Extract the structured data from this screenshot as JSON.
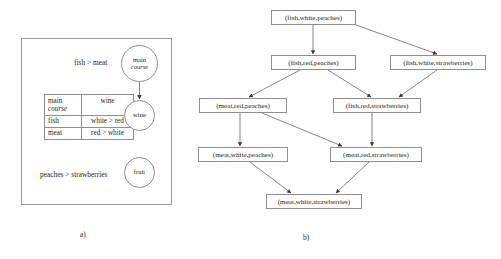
{
  "figure": {
    "captions": {
      "a": "a)",
      "b": "b)"
    }
  },
  "panel_a": {
    "statement_top": "fish > meat",
    "statement_bottom": "peaches > strawberries",
    "cp_table": {
      "headers": [
        "main course",
        "wine"
      ],
      "header_left_line1": "main",
      "header_left_line2": "course",
      "header_right": "wine",
      "rows": [
        {
          "condition": "fish",
          "preference": "white > red"
        },
        {
          "condition": "meat",
          "preference": "red > white"
        }
      ]
    },
    "nodes": [
      {
        "id": "main-course",
        "line1": "main",
        "line2": "course"
      },
      {
        "id": "wine",
        "line1": "wine",
        "line2": ""
      },
      {
        "id": "fruit",
        "line1": "fruit",
        "line2": ""
      }
    ]
  },
  "panel_b": {
    "nodes": [
      {
        "id": "n1",
        "label": "(fish,white,peaches)"
      },
      {
        "id": "n2",
        "label": "(fish,red,peaches)"
      },
      {
        "id": "n3",
        "label": "(fish,white,strawberries)"
      },
      {
        "id": "n4",
        "label": "(meat,red,peaches)"
      },
      {
        "id": "n5",
        "label": "(fish,red,strawberries)"
      },
      {
        "id": "n6",
        "label": "(meat,white,peaches)"
      },
      {
        "id": "n7",
        "label": "(meat,red,strawberries)"
      },
      {
        "id": "n8",
        "label": "(meat,white,strawberries)"
      }
    ],
    "edges": [
      {
        "from": "n1",
        "to": "n2"
      },
      {
        "from": "n1",
        "to": "n3"
      },
      {
        "from": "n2",
        "to": "n4"
      },
      {
        "from": "n2",
        "to": "n5"
      },
      {
        "from": "n3",
        "to": "n5"
      },
      {
        "from": "n4",
        "to": "n6"
      },
      {
        "from": "n4",
        "to": "n7"
      },
      {
        "from": "n5",
        "to": "n7"
      },
      {
        "from": "n6",
        "to": "n8"
      },
      {
        "from": "n7",
        "to": "n8"
      }
    ]
  },
  "colors": {
    "stroke": "#8f8f8f",
    "text": "#262626",
    "background": "#ffffff"
  }
}
